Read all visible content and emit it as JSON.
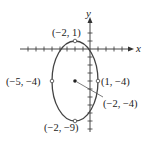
{
  "diagram": {
    "type": "ellipse-graph",
    "axes": {
      "x_label": "x",
      "y_label": "y"
    },
    "center": {
      "label": "(−2, −4)",
      "x": -2,
      "y": -4
    },
    "vertices": [
      {
        "name": "top",
        "label": "(−2, 1)",
        "x": -2,
        "y": 1
      },
      {
        "name": "bottom",
        "label": "(−2, −9)",
        "x": -2,
        "y": -9
      },
      {
        "name": "left",
        "label": "(−5, −4)",
        "x": -5,
        "y": -4
      },
      {
        "name": "right",
        "label": "(1, −4)",
        "x": 1,
        "y": -4
      }
    ],
    "colors": {
      "curve": "#444444",
      "axes": "#333333",
      "points": "#555555"
    }
  }
}
